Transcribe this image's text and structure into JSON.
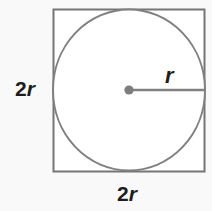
{
  "figure": {
    "background_color": "#f9f9f9",
    "stroke_color": "#7f7f7f",
    "square_stroke_color": "#757575",
    "text_color": "#1d1d1d",
    "fill_color": "#ffffff"
  },
  "labels": {
    "left_side": {
      "full": "2r",
      "coefficient": "2",
      "variable": "r"
    },
    "bottom_side": {
      "full": "2r",
      "coefficient": "2",
      "variable": "r"
    },
    "radius": {
      "full": "r",
      "variable": "r"
    }
  },
  "shapes": {
    "square": {
      "name": "square",
      "x": 53,
      "y": 9,
      "width": 152,
      "height": 163,
      "side_label": "2r"
    },
    "circle": {
      "name": "inscribed-circle",
      "cx": 129,
      "cy": 90,
      "rx": 76,
      "ry": 81,
      "radius_label": "r"
    },
    "center_point": {
      "name": "center-point",
      "cx": 129,
      "cy": 90,
      "r": 4.5
    },
    "radius_line": {
      "name": "radius-segment",
      "x1": 129,
      "y1": 90,
      "x2": 205,
      "y2": 90,
      "label": "r"
    }
  }
}
